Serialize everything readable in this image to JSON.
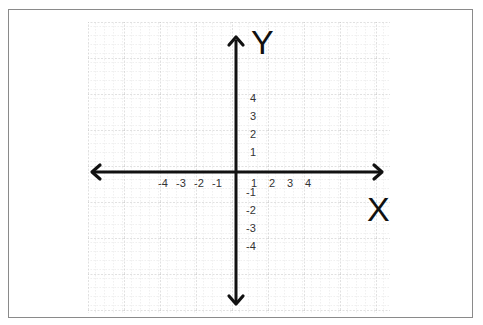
{
  "diagram": {
    "type": "cartesian-coordinate-plane",
    "axis_titles": {
      "x": "X",
      "y": "Y"
    },
    "x_tick_labels": {
      "negative": [
        "-4",
        "-3",
        "-2",
        "-1"
      ],
      "positive": [
        "1",
        "2",
        "3",
        "4"
      ]
    },
    "y_tick_labels": {
      "positive": [
        "4",
        "3",
        "2",
        "1"
      ],
      "negative": [
        "-1",
        "-2",
        "-3",
        "-4"
      ]
    },
    "colors": {
      "axis": "#111111",
      "grid_minor": "#cfcfcf",
      "grid_major": "#b8b8b8",
      "frame": "#8a8a8a",
      "label": "#333333"
    }
  }
}
